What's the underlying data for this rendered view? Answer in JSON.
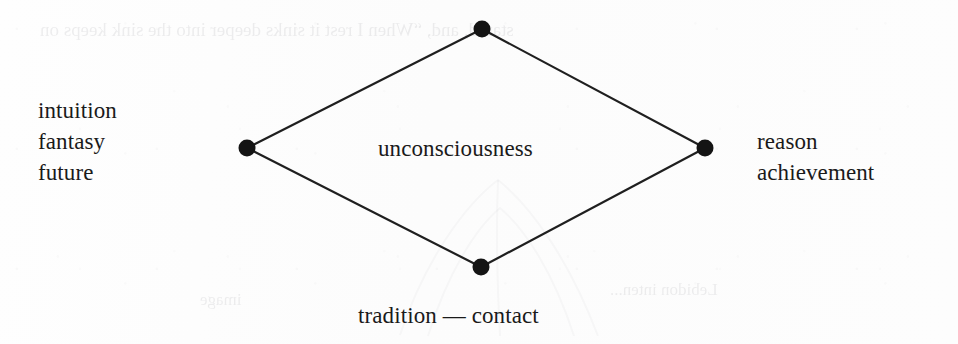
{
  "diagram": {
    "background_color": "#fdfdfd",
    "stroke_color": "#1f1f1f",
    "text_color": "#1a1a1a",
    "center_label": "unconsciousness",
    "bottom_label": "tradition — contact",
    "left_labels": [
      "intuition",
      "fantasy",
      "future"
    ],
    "right_labels": [
      "reason",
      "achievement"
    ],
    "vertices": [
      {
        "name": "top",
        "x": 482,
        "y": 29,
        "radius": 8
      },
      {
        "name": "left",
        "x": 247,
        "y": 148,
        "radius": 8
      },
      {
        "name": "right",
        "x": 705,
        "y": 148,
        "radius": 8
      },
      {
        "name": "bottom",
        "x": 481,
        "y": 267,
        "radius": 8
      }
    ],
    "ghost_text": {
      "top": "stared, and, “When I rest it sinks deeper into the sink keeps on",
      "bottom_left": "image",
      "bottom_right": "Lebidon inten..."
    }
  }
}
